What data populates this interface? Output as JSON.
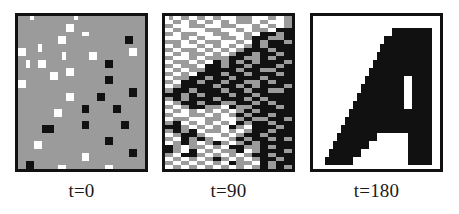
{
  "figure": {
    "kind": "cellular-automaton-time-series",
    "width": 459,
    "height": 214,
    "background": "#ffffff"
  },
  "palette": {
    "state_white": "#ffffff",
    "state_gray": "#9b9b9b",
    "state_black": "#111111",
    "border": "#111111",
    "label_text": "#1a1a1a"
  },
  "grid": {
    "cols": 32,
    "rows": 38,
    "legend": {
      "0": "white",
      "1": "gray",
      "2": "black"
    }
  },
  "panels": [
    {
      "id": "t0",
      "label": "t=0",
      "time": 0,
      "description": "Random initial condition: predominantly gray background with sparse white cells clustered toward the left and sparse black cells clustered toward the right.",
      "cells": [
        "11101111111111011111111111111111",
        "11111111111111111111111111111111",
        "11111111111100111111111111111111",
        "11111111111100111111111111111111",
        "11111111111111110011111111111111",
        "11111111110011111111111111122111",
        "11111111110011111111111111122111",
        "11111011111111111111111111111111",
        "00111011111111111111111111110011",
        "00111111111011111100111111110011",
        "11111111111011111100111111111111",
        "11011001111111111111112211111111",
        "11011001111111111111112211111111",
        "11111111111100111111111111111111",
        "11111111001100111111111111111111",
        "11111111001111111111112211111111",
        "00111111111111111111112211111111",
        "00111111111111111111111111111111",
        "11111111111111111111111111112211",
        "11111111111100111111221111112211",
        "11111111111100111111221111111111",
        "11111111111111111111111111111111",
        "11111111111111112211111122111111",
        "11111111100111112211111122111111",
        "11111111100111111111111111111111",
        "11111111111111111111111111111111",
        "11111111111111112211111111221111",
        "11111122211111112211111111221111",
        "11111122211111111111111111111111",
        "11111111111111111111111111111111",
        "11111111111111111111112211111111",
        "11110011111111111111112211111111",
        "11110011111111111111111111111111",
        "11111111111111111111111111112211",
        "11111111111111110011111111112211",
        "11111111111111110011111111111111",
        "11221111111111111111111111111111",
        "11221111110011111111110011111111"
      ]
    },
    {
      "id": "t90",
      "label": "t=90",
      "time": 90,
      "description": "Intermediate state: domains have coarsened. White domains dominate the left half, a large connected black domain occupies the upper-right, and gray cells form mixed boundaries between them.",
      "cells": [
        "01001100110011000011110000110011",
        "00110011001100110011110011000011",
        "11000011110000111100001100110011",
        "00110000001111000011001111002222",
        "11001111000011110000110022221122",
        "00001100110000111100112222111122",
        "11110011001111000011002211222211",
        "00110000110011001100112211222222",
        "11001111001100110011222222112222",
        "00110011110011001122221122221122",
        "11000011001111112222111122112222",
        "00111100110022112211221122222211",
        "11001111002222112222112222221122",
        "00110011112222222211222211112222",
        "11001100222222112222112222221122",
        "00111122221122221122222211222222",
        "11002222112222112222111122112222",
        "00112222222211222211221122222211",
        "11222211222222112222112222111122",
        "22221122112222221122221122222222",
        "11221122222211222222112211222222",
        "00112222112222111122221122112222",
        "11001122221111002211112222221122",
        "00110011001100110011221122222222",
        "11000011110011001122112222112222",
        "00111100001111000011221111222211",
        "11220011001100110022112222112222",
        "22221100110011002211002222221122",
        "11221122001111001100112222112222",
        "00112222110000110011222211222222",
        "11002211221100001122112222112211",
        "00112211001122110011221122222222",
        "22110011110011002222111122112222",
        "22110022001100111122001122222211",
        "11002222110011001100112222112222",
        "00110011001122110011001122221122",
        "11001100110011002211110022112222",
        "00110011001100110011001122112211"
      ]
    },
    {
      "id": "t180",
      "label": "t=180",
      "time": 180,
      "description": "Final converged state: a clean two-state image showing a solid black capital letter 'A' with a stair-stepped diagonal left leg, a rectangular right stem, and a small white counter, on a white background.",
      "cells": [
        "00000000000000000000000000000000",
        "00000000000000000000000000000000",
        "00000000000000000000000000000000",
        "00000000000000000000222222222200",
        "00000000000000000000222222222200",
        "00000000000000000022222222222200",
        "00000000000000000022222222222200",
        "00000000000000000222222222222200",
        "00000000000000000222222222222200",
        "00000000000000002222222222222200",
        "00000000000000002222222222222200",
        "00000000000000022222222222222200",
        "00000000000000022222222222222200",
        "00000000000000222222222222222200",
        "00000000000000222222222222222200",
        "00000000000002222222222002222200",
        "00000000000002222222222002222200",
        "00000000000022222222222002222200",
        "00000000000022222222222002222200",
        "00000000000222222222222002222200",
        "00000000000222222222222002222200",
        "00000000002222222222222002222200",
        "00000000002222222222222002222200",
        "00000000022222222222222222222200",
        "00000000022222222222222222222200",
        "00000000222222222222222222222200",
        "00000000222222222222222222222200",
        "00000002222222222222222222222200",
        "00000002222222222222222222222200",
        "00000022222222220000000022222200",
        "00000022222222220000000022222200",
        "00000222222222000000000022222200",
        "00000222222222000000000022222200",
        "00002222222200000000000022222200",
        "00002222222200000000000022222200",
        "00022222220000000000000022222200",
        "00022222220000000000000022222200",
        "00000000000000000000000000000000"
      ]
    }
  ]
}
